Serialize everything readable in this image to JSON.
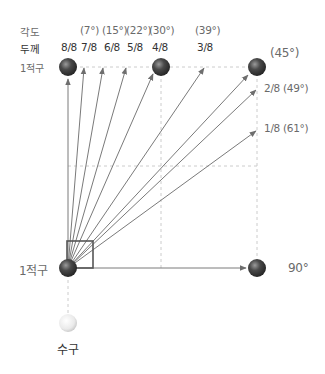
{
  "diagram": {
    "title_rows": {
      "angle_label": "각도",
      "thickness_label": "두께",
      "object_ball_label_top": "1적구"
    },
    "angles": [
      {
        "thickness": "8/8",
        "angle": ""
      },
      {
        "thickness": "7/8",
        "angle": "(7°)"
      },
      {
        "thickness": "6/8",
        "angle": "(15°)"
      },
      {
        "thickness": "5/8",
        "angle": "(22°)"
      },
      {
        "thickness": "4/8",
        "angle": "(30°)"
      },
      {
        "thickness": "3/8",
        "angle": "(39°)"
      }
    ],
    "right_labels": {
      "deg45": "(45°)",
      "two_eighths": "2/8 (49°)",
      "one_eighth": "1/8 (61°)",
      "deg90": "90°"
    },
    "object_ball_label_bottom": "1적구",
    "cue_ball_label": "수구",
    "colors": {
      "ball_dark": "#3c3c3c",
      "ball_highlight": "#8a8a8a",
      "arrow": "#7a7a7a",
      "grid_dashed": "#c8c8c8",
      "box": "#555555",
      "cue_ball": "#f2f2f2"
    }
  }
}
